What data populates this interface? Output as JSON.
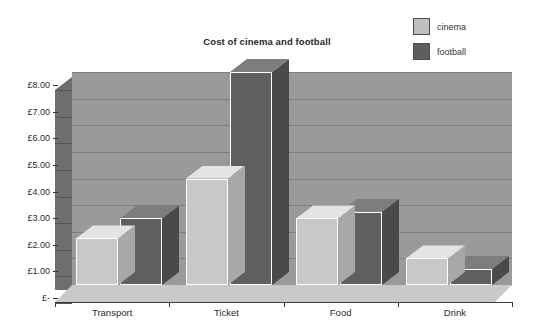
{
  "chart_data": {
    "type": "bar",
    "title": "Cost of cinema and football",
    "xlabel": "",
    "ylabel": "",
    "categories": [
      "Transport",
      "Ticket",
      "Food",
      "Drink"
    ],
    "series": [
      {
        "name": "cinema",
        "color": "#c8c8c8",
        "values": [
          1.75,
          4.0,
          2.5,
          1.0
        ]
      },
      {
        "name": "football",
        "color": "#5f5f5f",
        "values": [
          2.5,
          8.0,
          2.75,
          0.6
        ]
      }
    ],
    "ylim": [
      0,
      8
    ],
    "ytick_values": [
      0,
      1,
      2,
      3,
      4,
      5,
      6,
      7,
      8
    ],
    "ytick_labels": [
      "£-",
      "£1.00",
      "£2.00",
      "£3.00",
      "£4.00",
      "£5.00",
      "£6.00",
      "£7.00",
      "£8.00"
    ],
    "grid": true,
    "legend_position": "top-right",
    "three_d": true,
    "currency_symbol": "£"
  },
  "legend": {
    "items": [
      {
        "label": "cinema",
        "swatch_class": "sw-cinema"
      },
      {
        "label": "football",
        "swatch_class": "sw-football"
      }
    ]
  },
  "colors": {
    "plot_background": "#9a9a9a",
    "side_wall": "#6e6e6e",
    "floor": "#c9c9c9",
    "gridline": "#7e7e7e",
    "cinema": "#c8c8c8",
    "football": "#5f5f5f",
    "text": "#2b2b2b"
  }
}
